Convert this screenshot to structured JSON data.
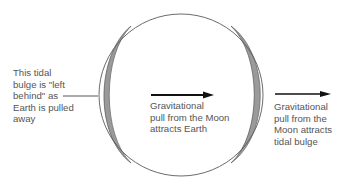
{
  "diagram": {
    "type": "tidal-bulge-diagram",
    "colors": {
      "outline": "#5a5a5a",
      "bulge_fill": "#9a9a9a",
      "arrow": "#111111",
      "text": "#555555"
    },
    "labels": {
      "left_bulge": [
        "This tidal",
        "bulge is \"left",
        "behind\" as",
        "Earth is pulled",
        "away"
      ],
      "earth_pull": [
        "Gravitational",
        "pull from the Moon",
        "attracts Earth"
      ],
      "bulge_pull": [
        "Gravitational",
        "pull from the",
        "Moon attracts",
        "tidal bulge"
      ]
    }
  }
}
